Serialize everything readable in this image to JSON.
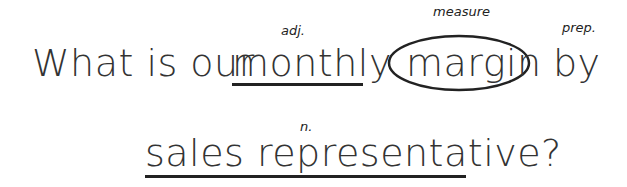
{
  "sentence": {
    "line1": {
      "prefix": "What is our",
      "adjective": "monthly",
      "measure": "margin",
      "preposition": "by"
    },
    "line2": {
      "noun": "sales representative?"
    }
  },
  "annotations": {
    "adjective_tag": "adj.",
    "measure_tag": "measure",
    "preposition_tag": "prep.",
    "noun_tag": "n."
  },
  "colors": {
    "text": "#333333",
    "markup": "#222222",
    "background": "#ffffff"
  }
}
